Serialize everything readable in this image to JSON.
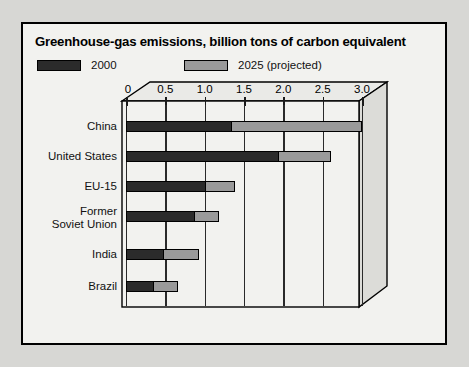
{
  "chart_data": {
    "type": "bar",
    "orientation": "horizontal",
    "title": "Greenhouse-gas emissions, billion tons of carbon equivalent",
    "xlabel": "",
    "ylabel": "",
    "xlim": [
      0,
      3.0
    ],
    "xticks": [
      "0",
      "0.5",
      "1.0",
      "1.5",
      "2.0",
      "2.5",
      "3.0"
    ],
    "xtick_values": [
      0,
      0.5,
      1.0,
      1.5,
      2.0,
      2.5,
      3.0
    ],
    "grid": true,
    "legend_position": "top-left",
    "stacked_style": "overlay-total",
    "categories": [
      "China",
      "United States",
      "EU-15",
      "Former\nSoviet Union",
      "India",
      "Brazil"
    ],
    "category_labels": [
      "China",
      "United States",
      "EU-15",
      "Former Soviet Union",
      "India",
      "Brazil"
    ],
    "series": [
      {
        "name": "2000",
        "color": "#2b2b2b",
        "values": [
          1.35,
          1.95,
          1.02,
          0.88,
          0.48,
          0.36
        ]
      },
      {
        "name": "2025 (projected)",
        "color": "#9a9a9a",
        "values": [
          3.0,
          2.6,
          1.38,
          1.18,
          0.93,
          0.66
        ]
      }
    ]
  },
  "legend": {
    "entries": [
      {
        "label": "2000",
        "color": "#2b2b2b"
      },
      {
        "label": "2025 (projected)",
        "color": "#9a9a9a"
      }
    ]
  },
  "colors": {
    "series_2000": "#2b2b2b",
    "series_2025": "#9a9a9a",
    "panel_background": "#f2f2ef",
    "page_background": "#d7d7d4",
    "frame": "#000000"
  }
}
